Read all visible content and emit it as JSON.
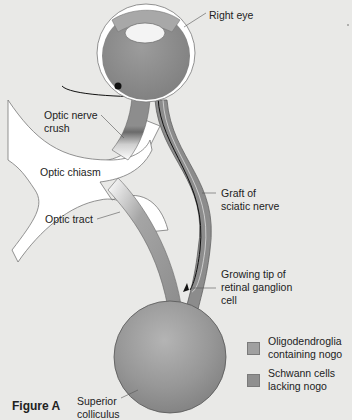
{
  "figure": {
    "title": "Figure A"
  },
  "labels": {
    "right_eye": "Right eye",
    "optic_nerve_crush_line1": "Optic nerve",
    "optic_nerve_crush_line2": "crush",
    "optic_chiasm": "Optic chiasm",
    "optic_tract": "Optic tract",
    "graft_line1": "Graft of",
    "graft_line2": "sciatic nerve",
    "growing_tip_line1": "Growing tip of",
    "growing_tip_line2": "retinal ganglion",
    "growing_tip_line3": "cell",
    "superior_colliculus_line1": "Superior",
    "superior_colliculus_line2": "colliculus"
  },
  "legend": {
    "items": [
      {
        "line1": "Oligodendroglia",
        "line2": "containing nogo",
        "color": "#a0a0a0"
      },
      {
        "line1": "Schwann cells",
        "line2": "lacking nogo",
        "color": "#8f8f8f"
      }
    ]
  },
  "colors": {
    "background": "#e9e9e7",
    "optic_nerve": "#8e8e8e",
    "graft": "#8a8a8a",
    "eyeball": "#8c8c8c",
    "colliculus": "#9a9a9a",
    "chiasm_white": "#ffffff"
  }
}
